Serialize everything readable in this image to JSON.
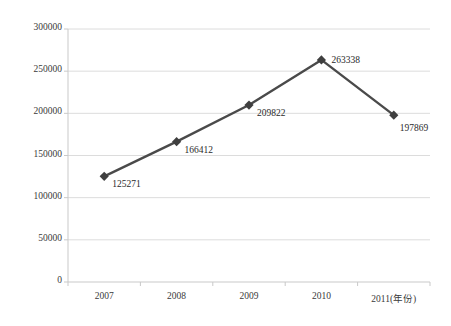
{
  "chart_data": {
    "type": "line",
    "title": "",
    "xlabel": "年份",
    "ylabel": "",
    "categories": [
      "2007",
      "2008",
      "2009",
      "2010",
      "2011"
    ],
    "x_tick_labels": [
      "2007",
      "2008",
      "2009",
      "2010",
      "2011(年份)"
    ],
    "values": [
      125271,
      166412,
      209822,
      263338,
      197869
    ],
    "data_labels": [
      "125271",
      "166412",
      "209822",
      "263338",
      "197869"
    ],
    "series": [
      {
        "name": "",
        "values": [
          125271,
          166412,
          209822,
          263338,
          197869
        ]
      }
    ],
    "ylim": [
      0,
      300000
    ],
    "y_tick_values": [
      0,
      50000,
      100000,
      150000,
      200000,
      250000,
      300000
    ],
    "y_tick_labels": [
      "0",
      "50000",
      "100000",
      "150000",
      "200000",
      "250000",
      "300000"
    ],
    "grid": true,
    "grid_axis": "y",
    "legend": false,
    "legend_position": "none",
    "marker": "diamond",
    "colors": {
      "line": "#4a4a4a",
      "marker": "#3f3f3f",
      "grid": "#dcdcdc",
      "axis": "#c9c9c9",
      "text": "#3a3a3a"
    }
  },
  "axes": {
    "y_axis_name": "value-axis",
    "x_axis_name": "category-axis"
  }
}
